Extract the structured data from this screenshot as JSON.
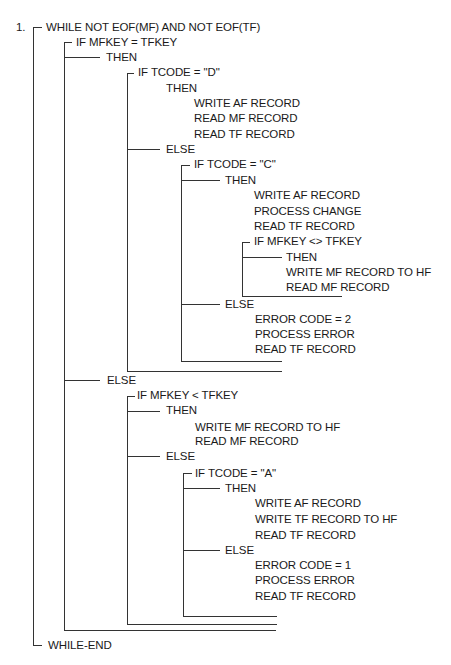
{
  "diagram": {
    "type": "structured-pseudocode-bracket-diagram",
    "step_number": "1.",
    "lines": [
      {
        "id": "l0",
        "text": "WHILE NOT EOF(MF) AND NOT EOF(TF)",
        "x": 46,
        "y": 27
      },
      {
        "id": "l1",
        "text": "IF MFKEY = TFKEY",
        "x": 76,
        "y": 42
      },
      {
        "id": "l2",
        "text": "THEN",
        "x": 106,
        "y": 57
      },
      {
        "id": "l3",
        "text": "IF TCODE = \"D\"",
        "x": 138,
        "y": 72
      },
      {
        "id": "l4",
        "text": "THEN",
        "x": 166,
        "y": 88
      },
      {
        "id": "l5",
        "text": "WRITE AF RECORD",
        "x": 194,
        "y": 103
      },
      {
        "id": "l6",
        "text": "READ MF RECORD",
        "x": 194,
        "y": 118
      },
      {
        "id": "l7",
        "text": "READ TF RECORD",
        "x": 194,
        "y": 134
      },
      {
        "id": "l8",
        "text": "ELSE",
        "x": 166,
        "y": 149
      },
      {
        "id": "l9",
        "text": "IF TCODE = \"C\"",
        "x": 194,
        "y": 164
      },
      {
        "id": "l10",
        "text": "THEN",
        "x": 225,
        "y": 180
      },
      {
        "id": "l11",
        "text": "WRITE AF RECORD",
        "x": 254,
        "y": 195
      },
      {
        "id": "l12",
        "text": "PROCESS CHANGE",
        "x": 254,
        "y": 211
      },
      {
        "id": "l13",
        "text": "READ TF RECORD",
        "x": 254,
        "y": 226
      },
      {
        "id": "l14",
        "text": "IF MFKEY <> TFKEY",
        "x": 254,
        "y": 241
      },
      {
        "id": "l15",
        "text": "THEN",
        "x": 286,
        "y": 257
      },
      {
        "id": "l16",
        "text": "WRITE MF RECORD TO HF",
        "x": 286,
        "y": 272
      },
      {
        "id": "l17",
        "text": "READ MF RECORD",
        "x": 286,
        "y": 287
      },
      {
        "id": "l18",
        "text": "ELSE",
        "x": 225,
        "y": 304
      },
      {
        "id": "l19",
        "text": "ERROR CODE = 2",
        "x": 255,
        "y": 319
      },
      {
        "id": "l20",
        "text": "PROCESS ERROR",
        "x": 255,
        "y": 334
      },
      {
        "id": "l21",
        "text": "READ TF RECORD",
        "x": 255,
        "y": 349
      },
      {
        "id": "l22",
        "text": "ELSE",
        "x": 107,
        "y": 380
      },
      {
        "id": "l23",
        "text": "IF MFKEY  < TFKEY",
        "x": 137,
        "y": 395
      },
      {
        "id": "l24",
        "text": "THEN",
        "x": 166,
        "y": 410
      },
      {
        "id": "l25",
        "text": "WRITE MF RECORD TO HF",
        "x": 195,
        "y": 427
      },
      {
        "id": "l26",
        "text": "READ MF RECORD",
        "x": 195,
        "y": 441
      },
      {
        "id": "l27",
        "text": "ELSE",
        "x": 166,
        "y": 456
      },
      {
        "id": "l28",
        "text": "IF TCODE = \"A\"",
        "x": 195,
        "y": 473
      },
      {
        "id": "l29",
        "text": "THEN",
        "x": 225,
        "y": 488
      },
      {
        "id": "l30",
        "text": "WRITE AF RECORD",
        "x": 255,
        "y": 503
      },
      {
        "id": "l31",
        "text": "WRITE TF RECORD TO HF",
        "x": 255,
        "y": 519
      },
      {
        "id": "l32",
        "text": "READ TF RECORD",
        "x": 255,
        "y": 535
      },
      {
        "id": "l33",
        "text": "ELSE",
        "x": 225,
        "y": 550
      },
      {
        "id": "l34",
        "text": "ERROR CODE = 1",
        "x": 255,
        "y": 565
      },
      {
        "id": "l35",
        "text": "PROCESS ERROR",
        "x": 255,
        "y": 580
      },
      {
        "id": "l36",
        "text": "READ TF RECORD",
        "x": 255,
        "y": 596
      },
      {
        "id": "l37",
        "text": "WHILE-END",
        "x": 48,
        "y": 645
      }
    ],
    "brackets": {
      "vertical": [
        {
          "x": 33,
          "y1": 27,
          "y2": 645
        },
        {
          "x": 64,
          "y1": 42,
          "y2": 630
        },
        {
          "x": 127,
          "y1": 73,
          "y2": 371
        },
        {
          "x": 181,
          "y1": 165,
          "y2": 361
        },
        {
          "x": 242,
          "y1": 242,
          "y2": 296
        },
        {
          "x": 127,
          "y1": 396,
          "y2": 624
        },
        {
          "x": 183,
          "y1": 473,
          "y2": 616
        }
      ],
      "horizontal": [
        {
          "x1": 33,
          "x2": 42,
          "y": 27
        },
        {
          "x1": 64,
          "x2": 72,
          "y": 42
        },
        {
          "x1": 64,
          "x2": 100,
          "y": 57
        },
        {
          "x1": 127,
          "x2": 134,
          "y": 73
        },
        {
          "x1": 127,
          "x2": 160,
          "y": 149
        },
        {
          "x1": 181,
          "x2": 190,
          "y": 165
        },
        {
          "x1": 181,
          "x2": 220,
          "y": 180
        },
        {
          "x1": 242,
          "x2": 250,
          "y": 242
        },
        {
          "x1": 242,
          "x2": 282,
          "y": 257
        },
        {
          "x1": 242,
          "x2": 342,
          "y": 296
        },
        {
          "x1": 181,
          "x2": 220,
          "y": 304
        },
        {
          "x1": 181,
          "x2": 282,
          "y": 361
        },
        {
          "x1": 127,
          "x2": 282,
          "y": 371
        },
        {
          "x1": 64,
          "x2": 100,
          "y": 380
        },
        {
          "x1": 127,
          "x2": 135,
          "y": 396
        },
        {
          "x1": 127,
          "x2": 160,
          "y": 411
        },
        {
          "x1": 127,
          "x2": 160,
          "y": 456
        },
        {
          "x1": 183,
          "x2": 192,
          "y": 473
        },
        {
          "x1": 183,
          "x2": 220,
          "y": 488
        },
        {
          "x1": 183,
          "x2": 220,
          "y": 550
        },
        {
          "x1": 183,
          "x2": 277,
          "y": 616
        },
        {
          "x1": 127,
          "x2": 277,
          "y": 624
        },
        {
          "x1": 64,
          "x2": 276,
          "y": 630
        },
        {
          "x1": 33,
          "x2": 42,
          "y": 645
        }
      ]
    }
  }
}
